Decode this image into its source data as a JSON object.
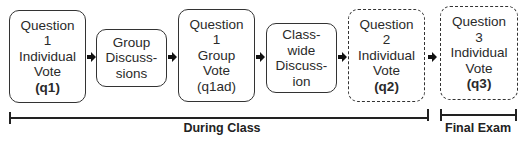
{
  "diagram": {
    "steps": [
      {
        "id": "q1",
        "lines": [
          "Question",
          "1",
          "Individual",
          "Vote"
        ],
        "code": "(q1)",
        "code_bold": true,
        "border": "solid"
      },
      {
        "id": "group-discussions",
        "lines": [
          "Group",
          "Discuss-",
          "sions"
        ],
        "code": "",
        "code_bold": false,
        "border": "solid"
      },
      {
        "id": "q1ad",
        "lines": [
          "Question",
          "1",
          "Group",
          "Vote"
        ],
        "code": "(q1ad)",
        "code_bold": false,
        "border": "solid"
      },
      {
        "id": "class-wide-discussion",
        "lines": [
          "Class-",
          "wide",
          "Discuss-",
          "ion"
        ],
        "code": "",
        "code_bold": false,
        "border": "solid"
      },
      {
        "id": "q2",
        "lines": [
          "Question",
          "2",
          "Individual",
          "Vote"
        ],
        "code": "(q2)",
        "code_bold": true,
        "border": "dashed"
      },
      {
        "id": "q3",
        "lines": [
          "Question",
          "3",
          "Individual",
          "Vote"
        ],
        "code": "(q3)",
        "code_bold": true,
        "border": "dashed"
      }
    ],
    "arrows": [
      "arrow-right",
      "arrow-right",
      "arrow-right",
      "arrow-right",
      "arrow-right"
    ],
    "timelines": [
      {
        "label": "During Class"
      },
      {
        "label": "Final Exam"
      }
    ]
  }
}
